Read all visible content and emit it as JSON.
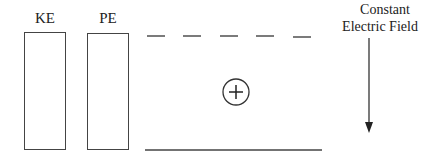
{
  "bars": [
    {
      "label": "KE"
    },
    {
      "label": "PE"
    }
  ],
  "field": {
    "title_line1": "Constant",
    "title_line2": "Electric Field",
    "direction": "down"
  },
  "particle": {
    "symbol": "+",
    "charge": "positive"
  },
  "plates": {
    "top": "dashed",
    "bottom": "solid"
  }
}
